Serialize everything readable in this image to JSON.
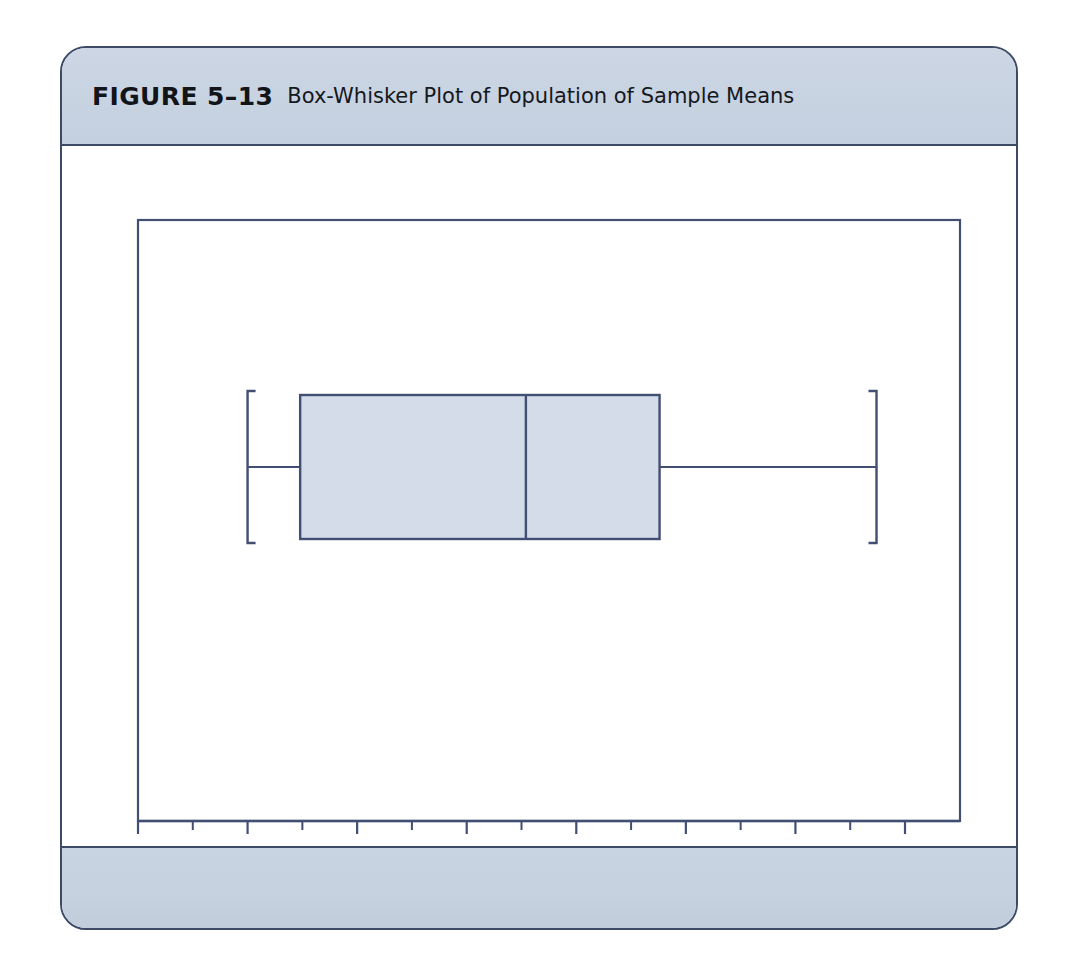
{
  "figure": {
    "label": "FIGURE 5–13",
    "title": "Box-Whisker Plot of Population of Sample Means"
  },
  "colors": {
    "frame_border": "#3d4a66",
    "band_fill": "#c8d3e2",
    "plot_line": "#424f72",
    "box_fill": "#d4dcea",
    "text": "#15181d",
    "page_background": "#ffffff"
  },
  "chart_data": {
    "type": "box",
    "title": "Box-Whisker Plot of Population of Sample Means",
    "xlabel": "Mean",
    "ylabel": "",
    "xlim": [
      54.0,
      92.0
    ],
    "grid": false,
    "legend": "none",
    "orientation": "horizontal",
    "axis": {
      "major_ticks": [
        55,
        60,
        65,
        70,
        75,
        80,
        85,
        90
      ],
      "tick_labels": [
        "55",
        "60",
        "65",
        "70",
        "75",
        "80",
        "85",
        "90"
      ],
      "minor_ticks": [
        57.5,
        62.5,
        67.5,
        72.5,
        77.5,
        82.5,
        87.5
      ],
      "minor_tick_step": 2.5
    },
    "boxes": [
      {
        "name": "Population of Sample Means",
        "min": 60.0,
        "q1": 62.4,
        "median": 72.7,
        "q3": 78.8,
        "max": 88.7,
        "outliers": []
      }
    ]
  },
  "plot_geometry": {
    "frame_left": 136,
    "frame_right": 958,
    "frame_top": 172,
    "frame_bottom": 773,
    "box_top": 421,
    "box_bottom": 565,
    "whisker_y": 493
  }
}
